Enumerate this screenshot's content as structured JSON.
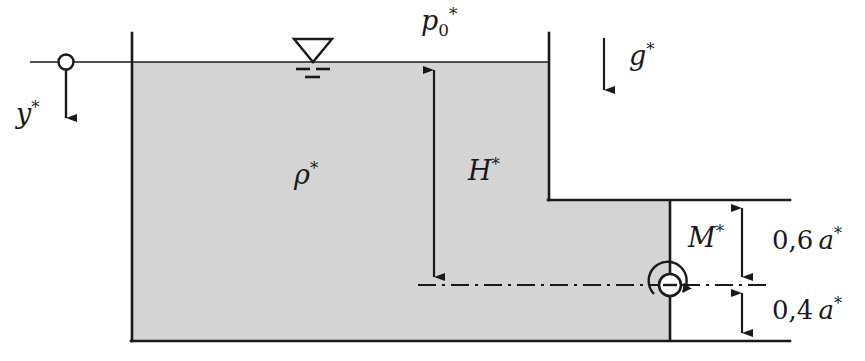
{
  "figure": {
    "background_color": "#ffffff",
    "line_color": "#1a1a1a",
    "fluid_fill_color": "#d4d4d4",
    "width": 865,
    "height": 361
  },
  "labels": {
    "y_axis": {
      "base": "y",
      "sup": "*",
      "text": "y*"
    },
    "p_zero": {
      "base": "p",
      "sub": "0",
      "sup": "*",
      "text": "p0*"
    },
    "gravity": {
      "base": "g",
      "sup": "*",
      "text": "g*"
    },
    "density": {
      "base": "ρ",
      "sup": "*",
      "text": "ρ*"
    },
    "depth": {
      "base": "H",
      "sup": "*",
      "text": "H*"
    },
    "moment": {
      "base": "M",
      "sup": "*",
      "text": "M*"
    },
    "dim_upper": {
      "value": "0,6",
      "var": "a",
      "sup": "*",
      "text": "0,6 a*"
    },
    "dim_lower": {
      "value": "0,4",
      "var": "a",
      "sup": "*",
      "text": "0,4 a*"
    }
  },
  "geometry": {
    "free_surface_y": 62,
    "tank_left_wall_x": 132,
    "tank_bottom_y": 341,
    "upper_right_wall_x": 549,
    "step_ledge_y": 200,
    "gate_x": 670,
    "centerline_y": 285,
    "dimension_line_x": 742,
    "bottom_line_right_x": 790,
    "origin_marker_x": 66,
    "surface_line_left_x": 30
  },
  "icons": {
    "origin_marker": "origin-circle-icon",
    "free_surface_symbol": "free-surface-triangle-icon",
    "hinge": "hinge-circle-icon",
    "moment_arrow": "curved-moment-arrow-icon"
  }
}
